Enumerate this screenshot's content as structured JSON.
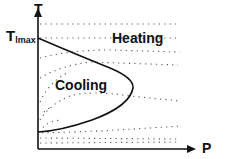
{
  "diagram": {
    "axes": {
      "y_label": "T",
      "x_label": "P",
      "y_marker_main": "T",
      "y_marker_sub": "lmax"
    },
    "regions": {
      "heating": "Heating",
      "cooling": "Cooling"
    },
    "colors": {
      "line": "#111111",
      "dots": "#555555",
      "background": "#ffffff"
    }
  }
}
